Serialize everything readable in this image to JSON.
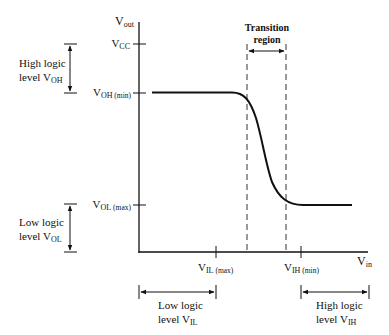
{
  "diagram": {
    "axes": {
      "y_label": {
        "main": "V",
        "sub": "out"
      },
      "x_label": {
        "main": "V",
        "sub": "in"
      }
    },
    "y_ticks": [
      {
        "id": "vcc",
        "main": "V",
        "sub": "CC",
        "extra": ""
      },
      {
        "id": "voh_min",
        "main": "V",
        "sub": "OH",
        "extra": " (min)"
      },
      {
        "id": "vol_max",
        "main": "V",
        "sub": "OL",
        "extra": " (max)"
      }
    ],
    "x_ticks": [
      {
        "id": "vil_max",
        "main": "V",
        "sub": "IL",
        "extra": " (max)"
      },
      {
        "id": "vih_min",
        "main": "V",
        "sub": "IH",
        "extra": " (min)"
      }
    ],
    "transition": {
      "line1": "Transition",
      "line2": "region"
    },
    "left_ranges": {
      "high": {
        "line1": "High logic",
        "line2_prefix": "level V",
        "line2_sub": "OH"
      },
      "low": {
        "line1": "Low logic",
        "line2_prefix": "level V",
        "line2_sub": "OL"
      }
    },
    "bottom_ranges": {
      "low": {
        "line1": "Low logic",
        "line2_prefix": "level V",
        "line2_sub": "IL"
      },
      "high": {
        "line1": "High logic",
        "line2_prefix": "level V",
        "line2_sub": "IH"
      }
    },
    "colors": {
      "ink": "#111111",
      "background": "#ffffff"
    }
  }
}
